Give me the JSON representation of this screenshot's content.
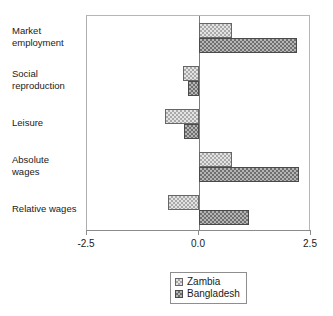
{
  "chart_data": {
    "type": "bar",
    "orientation": "horizontal",
    "title": "",
    "xlabel": "",
    "ylabel": "",
    "xlim": [
      -2.5,
      2.5
    ],
    "xticks": [
      -2.5,
      0.0,
      2.5
    ],
    "xticklabels": [
      "-2.5",
      "0.0",
      "2.5"
    ],
    "grid": false,
    "legend_position": "bottom-center",
    "categories": [
      "Market\nemployment",
      "Social\nreproduction",
      "Leisure",
      "Absolute\nwages",
      "Relative wages"
    ],
    "series": [
      {
        "name": "Zambia",
        "values": [
          0.74,
          -0.36,
          -0.76,
          0.74,
          -0.69
        ]
      },
      {
        "name": "Bangladesh",
        "values": [
          2.19,
          -0.25,
          -0.34,
          2.23,
          1.11
        ]
      }
    ]
  },
  "legend": {
    "items": [
      {
        "label": "Zambia"
      },
      {
        "label": "Bangladesh"
      }
    ]
  }
}
